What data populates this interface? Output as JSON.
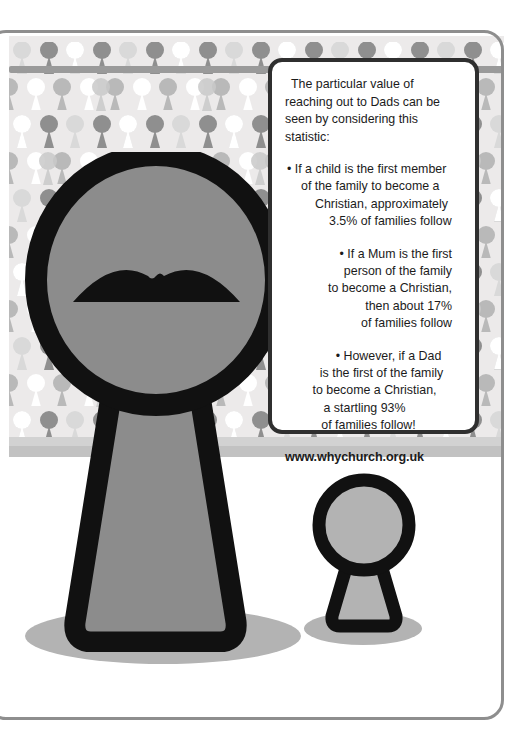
{
  "poster": {
    "title": "Reaching out to Dads keyhole poster",
    "colors": {
      "wall_bg": "#eceaea",
      "figure_fill": "#8c8c8c",
      "figure_outline": "#111111",
      "shadow": "#b3b3b3",
      "frame_border": "#8e8e8e",
      "card_border": "#2f2f2f",
      "text": "#1b1b1b"
    }
  },
  "wallpaper": {
    "motif": "keyhole-icon",
    "rail_label": "picture-rail",
    "skirting_label": "skirting-board",
    "swatches": [
      "#ffffff",
      "#dedede",
      "#c9c9c9",
      "#b0b0b0",
      "#8f8f8f",
      "#e8e8e8"
    ]
  },
  "figures": {
    "big": {
      "name": "dad-keyhole-figure",
      "feature": "moustache"
    },
    "small": {
      "name": "child-keyhole-figure"
    }
  },
  "card": {
    "intro": "The particular value of reaching out to Dads can be seen by considering this statistic:",
    "bullets": [
      {
        "marker": "•",
        "lines": [
          "If a child is the first member",
          "of the family to become a",
          "Christian, approximately",
          "3.5% of families follow"
        ]
      },
      {
        "marker": "•",
        "lines": [
          "If a Mum is the first",
          "person of the family",
          "to become a Christian,",
          "then about 17%",
          "of families follow"
        ]
      },
      {
        "marker": "•",
        "lines": [
          "However, if a Dad",
          "is the first of the family",
          "to become a Christian,",
          "a startling 93%",
          "of families follow!"
        ]
      }
    ],
    "url": "www.whychurch.org.uk"
  },
  "stats": {
    "child_first_percent": "3.5%",
    "mum_first_percent": "17%",
    "dad_first_percent": "93%"
  }
}
